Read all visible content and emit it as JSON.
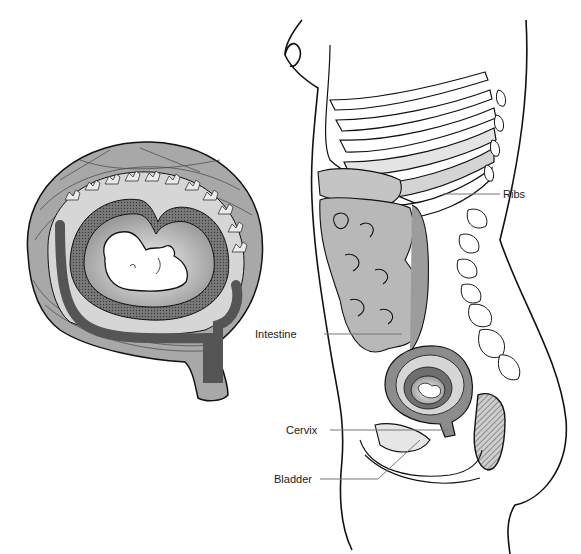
{
  "figure": {
    "left_panel": "Uterus cross-section with embryo",
    "right_panel": "Side view of pregnant female torso"
  },
  "labels": {
    "ribs": "Ribs",
    "intestine": "Intestine",
    "cervix": "Cervix",
    "bladder": "Bladder"
  },
  "colors": {
    "outline": "#111111",
    "muscle_wall": "#a8a8a8",
    "light_gray": "#d6d6d6",
    "mid_gray": "#8c8c8c",
    "dark_gray": "#555555",
    "leader_line": "#777777"
  }
}
